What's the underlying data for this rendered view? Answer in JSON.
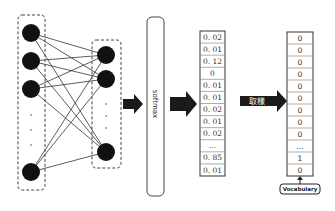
{
  "diagram": {
    "input_layer": {
      "nodes_shown": 4,
      "ellipsis": "..."
    },
    "hidden_layer": {
      "nodes_shown": 3,
      "ellipsis": "..."
    },
    "softmax_label": "softmax",
    "probabilities": [
      "0. 02",
      "0. 01",
      "0. 12",
      "0",
      "0. 01",
      "0. 01",
      "0. 02",
      "0. 01",
      "0. 02",
      "...",
      "0. 85",
      "0. 01"
    ],
    "sampling_label": "取樣",
    "one_hot": [
      "0",
      "0",
      "0",
      "0",
      "0",
      "0",
      "0",
      "0",
      "0",
      "...",
      "1",
      "0"
    ],
    "vocabulary_label": "Vocabulary",
    "colors": {
      "node": "#111111",
      "arrow": "#1a1a1a",
      "border": "#444444"
    }
  }
}
